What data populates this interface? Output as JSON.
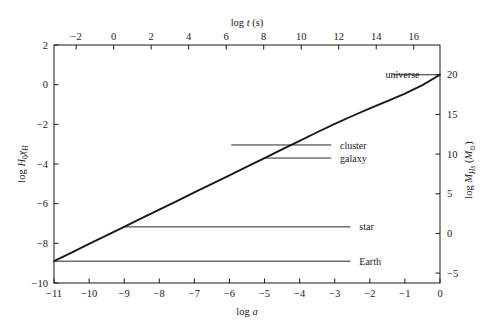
{
  "chart_data": {
    "type": "line",
    "title": "",
    "xlabel": "log a",
    "ylabel": "log H0χH",
    "top_axis_label": "log t (s)",
    "right_axis_label": "log MHs (M☉)",
    "xlim": [
      -11,
      0
    ],
    "ylim": [
      -10,
      2
    ],
    "top_xlim": [
      -3.18,
      17.4
    ],
    "right_ylim": [
      -6.25,
      23.75
    ],
    "grid": false,
    "legend_position": "none",
    "x_ticks": [
      "−11",
      "−10",
      "−9",
      "−8",
      "−7",
      "−6",
      "−5",
      "−4",
      "−3",
      "−2",
      "−1",
      "0"
    ],
    "x_tick_values": [
      -11,
      -10,
      -9,
      -8,
      -7,
      -6,
      -5,
      -4,
      -3,
      -2,
      -1,
      0
    ],
    "y_ticks": [
      "2",
      "0",
      "−2",
      "−4",
      "−6",
      "−8",
      "−10"
    ],
    "y_tick_values": [
      2,
      0,
      -2,
      -4,
      -6,
      -8,
      -10
    ],
    "top_ticks": [
      "−2",
      "0",
      "2",
      "4",
      "6",
      "8",
      "10",
      "12",
      "14",
      "16"
    ],
    "top_tick_values": [
      -2,
      0,
      2,
      4,
      6,
      8,
      10,
      12,
      14,
      16
    ],
    "right_ticks": [
      "25",
      "20",
      "15",
      "10",
      "5",
      "0",
      "−5"
    ],
    "right_tick_values": [
      25,
      20,
      15,
      10,
      5,
      0,
      -5
    ],
    "series": [
      {
        "name": "horizon",
        "comment": "log H0 chi_H versus log a",
        "x": [
          -11.0,
          -10.5,
          -10.0,
          -9.5,
          -9.0,
          -8.5,
          -8.0,
          -7.5,
          -7.0,
          -6.5,
          -6.0,
          -5.5,
          -5.0,
          -4.5,
          -4.0,
          -3.5,
          -3.0,
          -2.5,
          -2.0,
          -1.5,
          -1.0,
          -0.5,
          0.0
        ],
        "y": [
          -8.9,
          -8.47,
          -8.03,
          -7.6,
          -7.17,
          -6.73,
          -6.3,
          -5.87,
          -5.43,
          -5.0,
          -4.57,
          -4.13,
          -3.7,
          -3.26,
          -2.83,
          -2.4,
          -1.98,
          -1.58,
          -1.2,
          -0.83,
          -0.45,
          -0.02,
          0.5
        ]
      }
    ],
    "annotations": [
      {
        "label": "universe",
        "x_data": 0.0,
        "y_data": 0.5,
        "label_x_data": -1.55,
        "leader_from_x": -1.35
      },
      {
        "label": "cluster",
        "x_data": -5.95,
        "y_data": -3.04,
        "label_x_data": -2.85,
        "leader_from_x": -3.1
      },
      {
        "label": "galaxy",
        "x_data": -5.0,
        "y_data": -3.7,
        "label_x_data": -2.85,
        "leader_from_x": -3.1
      },
      {
        "label": "star",
        "x_data": -9.0,
        "y_data": -7.17,
        "label_x_data": -2.3,
        "leader_from_x": -2.55
      },
      {
        "label": "Earth",
        "x_data": -11.0,
        "y_data": -8.9,
        "label_x_data": -2.3,
        "leader_from_x": -2.55
      }
    ]
  },
  "figure": {
    "plot_left_px": 54,
    "plot_right_px": 440,
    "plot_top_px": 45,
    "plot_bottom_px": 283,
    "curve_color": "#1a1a1a",
    "axis_color": "#1a1a1a",
    "leader_color": "#2a2a2a",
    "background": "#ffffff"
  }
}
